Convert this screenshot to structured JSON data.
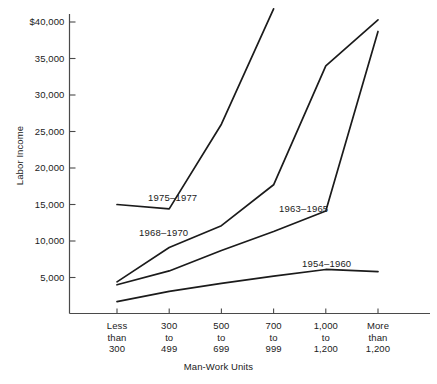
{
  "chart_data": {
    "type": "line",
    "title": "",
    "xlabel": "Man-Work Units",
    "ylabel": "Labor Income",
    "categories": [
      "Less than 300",
      "300 to 499",
      "500 to 699",
      "700 to 999",
      "1,000 to 1,200",
      "More than 1,200"
    ],
    "category_lines": [
      [
        "Less",
        "than",
        "300"
      ],
      [
        "300",
        "to",
        "499"
      ],
      [
        "500",
        "to",
        "699"
      ],
      [
        "700",
        "to",
        "999"
      ],
      [
        "1,000",
        "to",
        "1,200"
      ],
      [
        "More",
        "than",
        "1,200"
      ]
    ],
    "ylim": [
      0,
      42000
    ],
    "yticks": [
      5000,
      10000,
      15000,
      20000,
      25000,
      30000,
      35000,
      40000
    ],
    "ytick_labels": [
      "5,000",
      "10,000",
      "15,000",
      "20,000",
      "25,000",
      "30,000",
      "35,000",
      "$40,000"
    ],
    "grid": false,
    "legend": "inline-labels",
    "series": [
      {
        "name": "1975-1977",
        "label": "1975–1977",
        "values": [
          15000,
          14400,
          26000,
          41800,
          null,
          null
        ]
      },
      {
        "name": "1968-1970",
        "label": "1968–1970",
        "values": [
          4400,
          9100,
          12100,
          17700,
          34000,
          40300
        ]
      },
      {
        "name": "1963-1965",
        "label": "1963–1965",
        "values": [
          4000,
          5900,
          8700,
          11300,
          14100,
          38700
        ]
      },
      {
        "name": "1954-1960",
        "label": "1954–1960",
        "values": [
          1700,
          3100,
          4200,
          5200,
          6100,
          5800
        ]
      }
    ]
  },
  "annotations": {
    "corner_note": ""
  },
  "colors": {
    "line": "#1b1b1b",
    "axis": "#4a4a4a",
    "text": "#1b1b1b",
    "background": "#ffffff"
  }
}
